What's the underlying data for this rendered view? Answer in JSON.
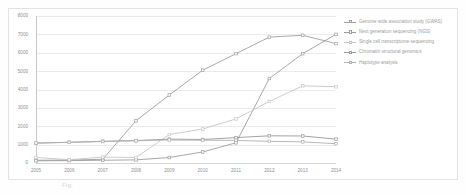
{
  "figure": {
    "title": "",
    "caption": "Fig."
  },
  "chart_data": {
    "type": "line",
    "title": "",
    "subtitle": "",
    "xlabel": "",
    "ylabel": "",
    "x": [
      2005,
      2006,
      2007,
      2008,
      2009,
      2010,
      2011,
      2012,
      2013,
      2014
    ],
    "categories": [
      "2005",
      "2006",
      "2007",
      "2008",
      "2009",
      "2010",
      "2011",
      "2012",
      "2013",
      "2014"
    ],
    "xlim": [
      2005,
      2014
    ],
    "ylim": [
      0,
      8000
    ],
    "yticks": [
      0,
      1000,
      2000,
      3000,
      4000,
      5000,
      6000,
      7000,
      8000
    ],
    "ytick_labels": [
      "0",
      "1000",
      "2000",
      "3000",
      "4000",
      "5000",
      "6000",
      "7000",
      "8000"
    ],
    "grid": true,
    "grid_axis": "y",
    "legend_position": "right",
    "markers": "square",
    "series": [
      {
        "name": "Genome wide association study (GWAS)",
        "color": "#a0a0a0",
        "values": [
          150,
          160,
          200,
          2300,
          3700,
          5050,
          5950,
          6850,
          6950,
          6500
        ]
      },
      {
        "name": "Next generation sequencing (NGS)",
        "color": "#9d9d9d",
        "values": [
          120,
          130,
          150,
          170,
          300,
          600,
          1100,
          4600,
          5950,
          7000
        ]
      },
      {
        "name": "Single cell transcriptome sequencing",
        "color": "#c6c6c6",
        "values": [
          300,
          180,
          320,
          300,
          1550,
          1850,
          2400,
          3350,
          4200,
          4150
        ]
      },
      {
        "name": "Chromatin structural genomics",
        "color": "#999999",
        "values": [
          1080,
          1130,
          1180,
          1220,
          1300,
          1280,
          1380,
          1480,
          1470,
          1300
        ]
      },
      {
        "name": "Haplotype analysis",
        "color": "#b0b0b0",
        "values": [
          1090,
          1120,
          1170,
          1210,
          1250,
          1240,
          1230,
          1180,
          1150,
          1050
        ]
      }
    ]
  },
  "legend": {
    "items": [
      {
        "label": "Genome wide association study (GWAS)"
      },
      {
        "label": "Next generation sequencing (NGS)"
      },
      {
        "label": "Single cell transcriptome sequencing"
      },
      {
        "label": "Chromatin structural genomics"
      },
      {
        "label": "Haplotype analysis"
      }
    ]
  }
}
